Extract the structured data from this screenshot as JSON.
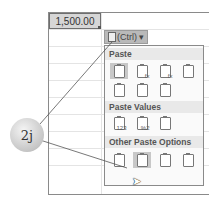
{
  "cell": {
    "value": "1,500.00"
  },
  "paste_options_button": {
    "label": "(Ctrl)",
    "dropdown": "▾"
  },
  "menu": {
    "sections": [
      {
        "title": "Paste",
        "icons": [
          "paste-icon",
          "paste-formulas-icon",
          "paste-formulas-number-formatting-icon",
          "keep-source-formatting-icon",
          "no-borders-icon",
          "keep-source-column-widths-icon",
          "transpose-icon"
        ]
      },
      {
        "title": "Paste Values",
        "icons": [
          "values-icon",
          "values-number-formatting-icon",
          "values-source-formatting-icon"
        ]
      },
      {
        "title": "Other Paste Options",
        "icons": [
          "formatting-icon",
          "paste-link-icon",
          "picture-icon",
          "linked-picture-icon"
        ]
      }
    ]
  },
  "callout": {
    "label": "2j"
  },
  "glyphs": {
    "fx": "fx",
    "v123": "123",
    "v2": "%2"
  }
}
